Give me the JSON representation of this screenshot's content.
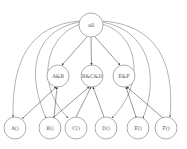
{
  "diagram": {
    "type": "dependency-graph",
    "nodes": [
      {
        "id": "all",
        "label": "all",
        "x": 91,
        "y": 25,
        "r": 12
      },
      {
        "id": "ab",
        "label": "A&B",
        "x": 58,
        "y": 76,
        "r": 11
      },
      {
        "id": "bcd",
        "label": "B&C&D",
        "x": 92,
        "y": 76,
        "r": 11
      },
      {
        "id": "ef",
        "label": "E&F",
        "x": 124,
        "y": 76,
        "r": 11
      },
      {
        "id": "a",
        "label": "A()",
        "x": 15,
        "y": 128,
        "r": 11
      },
      {
        "id": "b",
        "label": "B()",
        "x": 52,
        "y": 128,
        "r": 11
      },
      {
        "id": "c",
        "label": "C()",
        "x": 73,
        "y": 128,
        "r": 11
      },
      {
        "id": "d",
        "label": "D()",
        "x": 107,
        "y": 128,
        "r": 11
      },
      {
        "id": "e",
        "label": "E()",
        "x": 138,
        "y": 128,
        "r": 11
      },
      {
        "id": "f",
        "label": "F()",
        "x": 168,
        "y": 128,
        "r": 11
      }
    ],
    "edges": [
      {
        "from": "all",
        "to": "ab",
        "style": "straight"
      },
      {
        "from": "all",
        "to": "bcd",
        "style": "straight"
      },
      {
        "from": "all",
        "to": "ef",
        "style": "straight"
      },
      {
        "from": "all",
        "to": "a",
        "style": "arc"
      },
      {
        "from": "all",
        "to": "b",
        "style": "arc"
      },
      {
        "from": "all",
        "to": "c",
        "style": "arc"
      },
      {
        "from": "all",
        "to": "d",
        "style": "arc"
      },
      {
        "from": "all",
        "to": "e",
        "style": "arc"
      },
      {
        "from": "all",
        "to": "f",
        "style": "arc"
      },
      {
        "from": "a",
        "to": "ab",
        "style": "straight"
      },
      {
        "from": "b",
        "to": "ab",
        "style": "straight"
      },
      {
        "from": "b",
        "to": "bcd",
        "style": "straight"
      },
      {
        "from": "c",
        "to": "bcd",
        "style": "straight"
      },
      {
        "from": "d",
        "to": "bcd",
        "style": "straight"
      },
      {
        "from": "e",
        "to": "ef",
        "style": "straight"
      },
      {
        "from": "f",
        "to": "ef",
        "style": "straight"
      }
    ]
  }
}
